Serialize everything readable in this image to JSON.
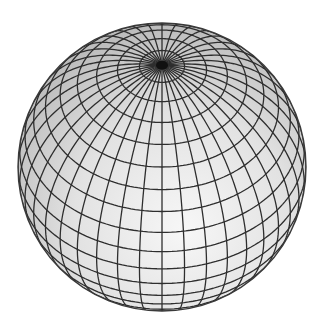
{
  "figure": {
    "view": {
      "center_x": 162,
      "center_y": 167,
      "radius": 144,
      "elevation_deg": 45,
      "azimuth_offset_deg": 0
    },
    "grid": {
      "meridians": 40,
      "latitude_step_deg": 9
    },
    "colors": {
      "background": "#ffffff",
      "line": "#2e2e2e",
      "shade_light": "#f7f7f7",
      "shade_mid": "#e2e2e2",
      "shade_dark": "#b9b9b9",
      "pole": "#111111"
    },
    "line_width": 1.3
  }
}
